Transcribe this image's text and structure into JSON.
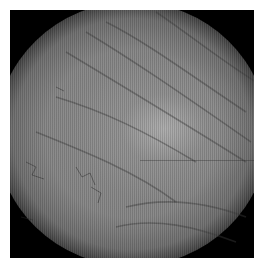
{
  "image": {
    "description": "Grayscale fundus/retinal photograph showing a circular field with diagonal vessel-like streaks and a brighter region at center-right",
    "background_color": "#ffffff",
    "field_color": "#000000",
    "tone": "grayscale"
  }
}
